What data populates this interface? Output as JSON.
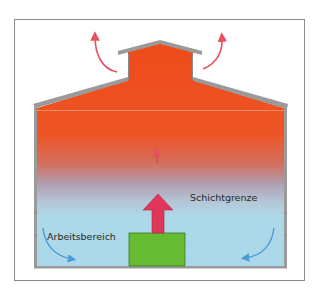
{
  "diagram": {
    "title": "",
    "labels": {
      "work_zone": "Arbeitsbereich",
      "stratification_boundary": "Schichtgrenze"
    },
    "colors": {
      "hot_air": "#ee4a1a",
      "cool_air": "#add8e8",
      "transition": "#b0a4b8",
      "heat_source": "#66bb33",
      "heat_arrow": "#e0365a",
      "exhaust_arrow": "#e85060",
      "return_arrow": "#4a9ad8",
      "walls": "#9a9a9a",
      "frame": "#8a8a8a"
    },
    "elements": [
      {
        "name": "building-section",
        "description": "cross section of hall with roof lantern"
      },
      {
        "name": "heat-source",
        "description": "green block on floor"
      },
      {
        "name": "rising-heat-arrow",
        "description": "large red upward arrow"
      },
      {
        "name": "small-rising-arrow",
        "description": "thin red upward arrow in transition zone"
      },
      {
        "name": "exhaust-arrows",
        "description": "two curved red arrows leaving lantern"
      },
      {
        "name": "return-airflow-arrows",
        "description": "two curved blue arrows near floor corners"
      }
    ]
  }
}
